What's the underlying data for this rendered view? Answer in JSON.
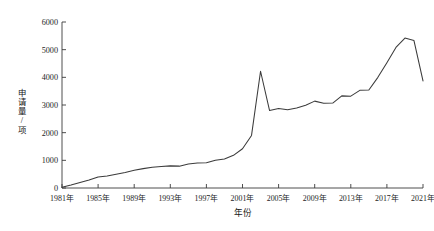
{
  "chart_data": {
    "type": "line",
    "title": "",
    "xlabel": "年份",
    "ylabel": "申请量/项",
    "xlim": [
      1981,
      2021
    ],
    "ylim": [
      0,
      6000
    ],
    "grid": false,
    "legend": null,
    "x_tick_labels": [
      "1981年",
      "1985年",
      "1989年",
      "1993年",
      "1997年",
      "2001年",
      "2005年",
      "2009年",
      "2013年",
      "2017年",
      "2021年"
    ],
    "x_tick_values": [
      1981,
      1985,
      1989,
      1993,
      1997,
      2001,
      2005,
      2009,
      2013,
      2017,
      2021
    ],
    "y_tick_labels": [
      "0",
      "1000",
      "2000",
      "3000",
      "4000",
      "5000",
      "6000"
    ],
    "y_tick_values": [
      0,
      1000,
      2000,
      3000,
      4000,
      5000,
      6000
    ],
    "x": [
      1981,
      1982,
      1983,
      1984,
      1985,
      1986,
      1987,
      1988,
      1989,
      1990,
      1991,
      1992,
      1993,
      1994,
      1995,
      1996,
      1997,
      1998,
      1999,
      2000,
      2001,
      2002,
      2003,
      2004,
      2005,
      2006,
      2007,
      2008,
      2009,
      2010,
      2011,
      2012,
      2013,
      2014,
      2015,
      2016,
      2017,
      2018,
      2019,
      2020,
      2021
    ],
    "series": [
      {
        "name": "申请量",
        "values": [
          30,
          110,
          200,
          290,
          400,
          430,
          500,
          560,
          640,
          700,
          750,
          780,
          800,
          790,
          870,
          900,
          910,
          1000,
          1050,
          1180,
          1420,
          1900,
          4220,
          2800,
          2870,
          2830,
          2890,
          2990,
          3140,
          3060,
          3070,
          3330,
          3320,
          3530,
          3540,
          4000,
          4530,
          5080,
          5420,
          5330,
          3870
        ]
      }
    ]
  },
  "axis": {
    "y_title_chars": [
      "申",
      "请",
      "量",
      "/",
      "项"
    ]
  }
}
